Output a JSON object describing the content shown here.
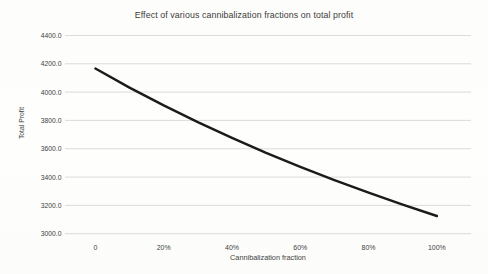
{
  "chart_data": {
    "type": "line",
    "title": "Effect of various cannibalization fractions on total profit",
    "xlabel": "Cannibalization fraction",
    "ylabel": "Total Profit",
    "x": [
      0,
      0.1,
      0.2,
      0.3,
      0.4,
      0.5,
      0.6,
      0.7,
      0.8,
      0.9,
      1.0
    ],
    "values": [
      4166.7,
      4032.3,
      3906.3,
      3787.9,
      3676.5,
      3571.4,
      3472.2,
      3378.4,
      3289.5,
      3205.1,
      3125.0
    ],
    "xtick_positions": [
      0,
      0.2,
      0.4,
      0.6,
      0.8,
      1.0
    ],
    "xtick_labels": [
      "0",
      "20%",
      "40%",
      "60%",
      "80%",
      "100%"
    ],
    "ytick_values": [
      4400,
      4200,
      4000,
      3800,
      3600,
      3400,
      3200,
      3000
    ],
    "ytick_labels": [
      "4400.0",
      "4200.0",
      "4000.0",
      "3800.0",
      "3600.0",
      "3400.0",
      "3200.0",
      "3000.0"
    ],
    "xlim": [
      -0.089,
      1.1
    ],
    "ylim": [
      3000,
      4400
    ],
    "grid": "horizontal-only",
    "legend": "none",
    "colors": {
      "line": "#1b1b1b",
      "gridline": "#d7d7d3",
      "text": "#3f3f3f",
      "background": "#fdfdfb"
    }
  }
}
